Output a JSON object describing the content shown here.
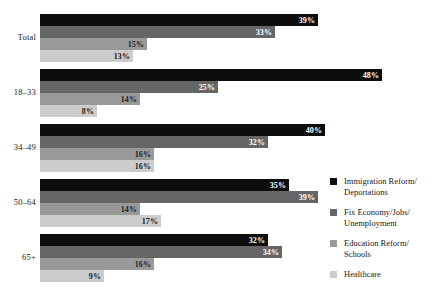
{
  "chart_data": {
    "type": "bar",
    "orientation": "horizontal",
    "title": "",
    "xlabel": "",
    "ylabel": "",
    "xlim": [
      0,
      50
    ],
    "grid": false,
    "legend_position": "right",
    "value_suffix": "%",
    "categories": [
      "Total",
      "18–33",
      "34–49",
      "50–64",
      "65+"
    ],
    "series": [
      {
        "name": "Immigration Reform/\nDeportations",
        "color": "#0d0d0d",
        "values": [
          39,
          48,
          40,
          35,
          32
        ]
      },
      {
        "name": "Fix Economy/Jobs/\nUnemployment",
        "color": "#666666",
        "values": [
          33,
          25,
          32,
          39,
          34
        ]
      },
      {
        "name": "Education Reform/\nSchools",
        "color": "#999999",
        "values": [
          15,
          14,
          16,
          14,
          16
        ]
      },
      {
        "name": "Healthcare",
        "color": "#cccccc",
        "values": [
          13,
          8,
          16,
          17,
          9
        ]
      }
    ],
    "value_labels": {
      "Total": [
        "39%",
        "33%",
        "15%",
        "13%"
      ],
      "18–33": [
        "48%",
        "25%",
        "14%",
        "8%"
      ],
      "34–49": [
        "40%",
        "32%",
        "16%",
        "16%"
      ],
      "50–64": [
        "35%",
        "39%",
        "14%",
        "17%"
      ],
      "65+": [
        "32%",
        "34%",
        "16%",
        "9%"
      ]
    }
  },
  "legend": {
    "items": [
      {
        "label": "Immigration Reform/\nDeportations",
        "color": "#0d0d0d"
      },
      {
        "label": "Fix Economy/Jobs/\nUnemployment",
        "color": "#666666"
      },
      {
        "label": "Education Reform/\nSchools",
        "color": "#999999"
      },
      {
        "label": "Healthcare",
        "color": "#cccccc"
      }
    ]
  }
}
